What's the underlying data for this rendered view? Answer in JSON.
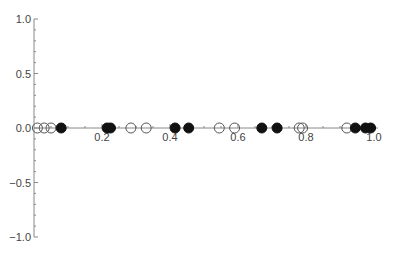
{
  "chart_data": {
    "type": "scatter",
    "title": "",
    "xlabel": "",
    "ylabel": "",
    "xlim": [
      0,
      1.0
    ],
    "ylim": [
      -1.0,
      1.0
    ],
    "grid": false,
    "legend": null,
    "x_ticks": [
      "0.2",
      "0.4",
      "0.6",
      "0.8",
      "1.0"
    ],
    "y_ticks": [
      "1.0",
      "0.5",
      "0.0",
      "−0.5",
      "−1.0"
    ],
    "series": [
      {
        "name": "open",
        "marker": "open-circle",
        "x": [
          0.01,
          0.03,
          0.05,
          0.285,
          0.33,
          0.545,
          0.59,
          0.78,
          0.79,
          0.92
        ],
        "y": [
          0,
          0,
          0,
          0,
          0,
          0,
          0,
          0,
          0,
          0
        ]
      },
      {
        "name": "filled",
        "marker": "filled-circle",
        "x": [
          0.08,
          0.215,
          0.225,
          0.415,
          0.455,
          0.67,
          0.715,
          0.945,
          0.975,
          0.99
        ],
        "y": [
          0,
          0,
          0,
          0,
          0,
          0,
          0,
          0,
          0,
          0
        ]
      }
    ]
  },
  "style": {
    "axis_color": "#888888",
    "open_stroke": "#555555",
    "filled_color": "#111111"
  }
}
